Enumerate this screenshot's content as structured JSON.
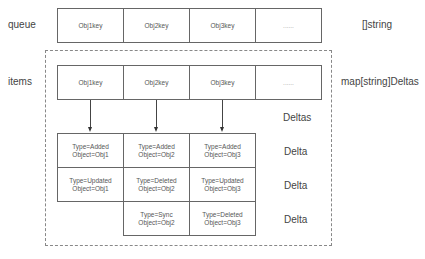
{
  "diagram": {
    "queue": {
      "label": "queue",
      "type_label": "[]string",
      "cells": [
        "Obj1key",
        "Obj2key",
        "Obj3key",
        "......"
      ]
    },
    "items": {
      "label": "items",
      "type_label": "map[string]Deltas",
      "cells": [
        "Obj1key",
        "Obj2key",
        "Obj3key",
        "......"
      ]
    },
    "deltas_label": "Deltas",
    "delta_label": "Delta",
    "delta_rows": [
      {
        "label": "Delta",
        "cells": [
          {
            "type": "Type=Added",
            "object": "Object=Obj1"
          },
          {
            "type": "Type=Added",
            "object": "Object=Obj2"
          },
          {
            "type": "Type=Added",
            "object": "Object=Obj3"
          }
        ]
      },
      {
        "label": "Delta",
        "cells": [
          {
            "type": "Type=Updated",
            "object": "Object=Obj1"
          },
          {
            "type": "Type=Deleted",
            "object": "Object=Obj2"
          },
          {
            "type": "Type=Updated",
            "object": "Object=Obj3"
          }
        ]
      },
      {
        "label": "Delta",
        "cells": [
          null,
          {
            "type": "Type=Sync",
            "object": "Object=Obj2"
          },
          {
            "type": "Type=Deleted",
            "object": "Object=Obj3"
          }
        ]
      }
    ],
    "colors": {
      "border": "#666666",
      "dashed_border": "#888888",
      "text": "#444444",
      "background": "#ffffff"
    }
  }
}
